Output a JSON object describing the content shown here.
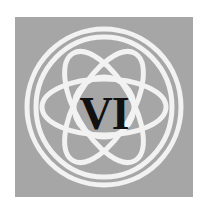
{
  "emblem": {
    "numeral": "VI",
    "background_color": "#a6a6a6",
    "knot_color": "#f2f2f2",
    "text_color": "#111111",
    "icon": "celtic-knot-icon"
  }
}
